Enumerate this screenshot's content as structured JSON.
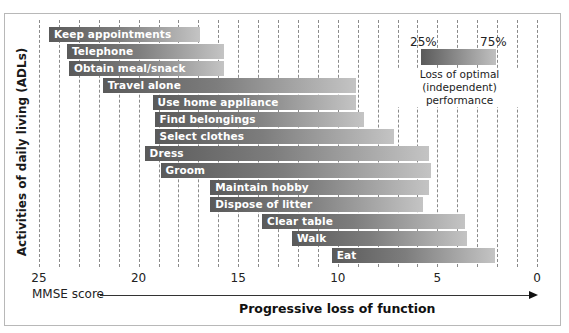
{
  "chart_data": {
    "type": "bar",
    "orientation": "horizontal-range",
    "title": "",
    "xlabel": "Progressive loss of function",
    "x_axis_name": "MMSE score",
    "ylabel": "Activities of daily living (ADLs)",
    "xlim": [
      25,
      0
    ],
    "x_ticks": [
      25,
      20,
      15,
      10,
      5,
      0
    ],
    "grid": "vertical dashed lines at every 1 MMSE point",
    "legend": {
      "position": "top-right",
      "low_label": "25%",
      "high_label": "75%",
      "caption": "Loss of optimal (independent) performance",
      "encoding": "bar gradient dark (25% loss) to light (75% loss)"
    },
    "categories": [
      "Keep appointments",
      "Telephone",
      "Obtain meal/snack",
      "Travel alone",
      "Use home appliance",
      "Find belongings",
      "Select clothes",
      "Dress",
      "Groom",
      "Maintain hobby",
      "Dispose of litter",
      "Clear table",
      "Walk",
      "Eat"
    ],
    "series": [
      {
        "name": "MMSE at 25% loss (bar start)",
        "values": [
          24.5,
          23.6,
          23.5,
          21.8,
          19.3,
          19.2,
          19.2,
          19.7,
          18.9,
          16.4,
          16.4,
          13.8,
          12.3,
          10.3
        ]
      },
      {
        "name": "MMSE at 75% loss (bar end)",
        "values": [
          16.9,
          15.7,
          15.7,
          9.1,
          9.1,
          8.7,
          7.2,
          5.4,
          5.3,
          5.4,
          5.7,
          3.6,
          3.5,
          2.1
        ]
      }
    ]
  },
  "axis": {
    "ylabel": "Activities of daily living (ADLs)",
    "x_name": "MMSE score",
    "xlabel": "Progressive loss of function",
    "ticks": [
      {
        "label": "25",
        "value": 25
      },
      {
        "label": "20",
        "value": 20
      },
      {
        "label": "15",
        "value": 15
      },
      {
        "label": "10",
        "value": 10
      },
      {
        "label": "5",
        "value": 5
      },
      {
        "label": "0",
        "value": 0
      }
    ]
  },
  "legend": {
    "low_label": "25%",
    "high_label": "75%",
    "caption_line1": "Loss of optimal",
    "caption_line2": "(independent) performance"
  },
  "bars": [
    {
      "label": "Keep appointments",
      "start": 24.5,
      "end": 16.9
    },
    {
      "label": "Telephone",
      "start": 23.6,
      "end": 15.7
    },
    {
      "label": "Obtain meal/snack",
      "start": 23.5,
      "end": 15.7
    },
    {
      "label": "Travel alone",
      "start": 21.8,
      "end": 9.1
    },
    {
      "label": "Use home appliance",
      "start": 19.3,
      "end": 9.1
    },
    {
      "label": "Find belongings",
      "start": 19.2,
      "end": 8.7
    },
    {
      "label": "Select clothes",
      "start": 19.2,
      "end": 7.2
    },
    {
      "label": "Dress",
      "start": 19.7,
      "end": 5.4
    },
    {
      "label": "Groom",
      "start": 18.9,
      "end": 5.3
    },
    {
      "label": "Maintain hobby",
      "start": 16.4,
      "end": 5.4
    },
    {
      "label": "Dispose of litter",
      "start": 16.4,
      "end": 5.7
    },
    {
      "label": "Clear table",
      "start": 13.8,
      "end": 3.6
    },
    {
      "label": "Walk",
      "start": 12.3,
      "end": 3.5
    },
    {
      "label": "Eat",
      "start": 10.3,
      "end": 2.1
    }
  ]
}
